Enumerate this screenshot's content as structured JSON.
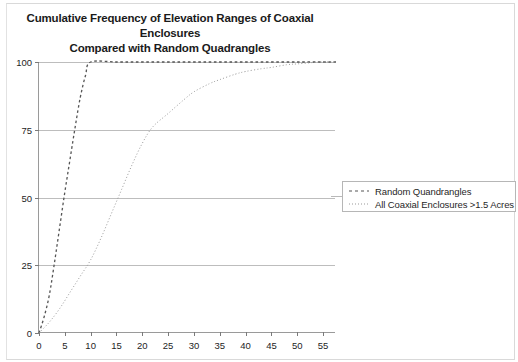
{
  "figure": {
    "width": 518,
    "height": 362,
    "background": "#ffffff",
    "border_color": "#d9d9d9"
  },
  "chart_data": {
    "type": "line",
    "title": "Cumulative Frequency of Elevation Ranges of Coaxial Enclosures Compared with Random Quadrangles",
    "title_line1": "Cumulative Frequency of Elevation Ranges of Coaxial Enclosures",
    "title_line2": "Compared with Random Quadrangles",
    "subtitle": "",
    "xlabel": "",
    "ylabel": "",
    "xlim": [
      0,
      57.5
    ],
    "ylim": [
      0,
      100
    ],
    "xticks": [
      0,
      5,
      10,
      15,
      20,
      25,
      30,
      35,
      40,
      45,
      50,
      55
    ],
    "yticks": [
      0,
      25,
      50,
      75,
      100
    ],
    "grid": "horizontal",
    "legend_position": "right-outside",
    "series": [
      {
        "name": "Random Quandrangles",
        "style": "dashed",
        "color": "#555555",
        "x": [
          0,
          1,
          2,
          3,
          4,
          5,
          6,
          7,
          8,
          9,
          10,
          15,
          20,
          25,
          30,
          35,
          40,
          45,
          50,
          55,
          57.5
        ],
        "values": [
          0,
          6,
          14,
          26,
          39,
          52,
          64,
          76,
          87,
          95,
          100,
          100,
          100,
          100,
          100,
          100,
          100,
          100,
          100,
          100,
          100
        ]
      },
      {
        "name": "All Coaxial Enclosures >1.5 Acres",
        "style": "dotted",
        "color": "#9a9a9a",
        "x": [
          0,
          2,
          4,
          6,
          8,
          10,
          12,
          14,
          16,
          18,
          20,
          22,
          25,
          28,
          30,
          33,
          35,
          38,
          40,
          43,
          45,
          48,
          50,
          53,
          55,
          57.5
        ],
        "values": [
          0,
          4,
          9,
          15,
          21,
          27,
          35,
          44,
          53,
          62,
          70,
          76,
          81,
          86,
          89,
          92,
          93.5,
          95.5,
          96.5,
          97.5,
          98,
          99,
          99.3,
          99.8,
          100,
          100
        ]
      }
    ]
  },
  "legend": {
    "items": [
      {
        "label": "Random Quandrangles",
        "style": "dashed",
        "color": "#555555"
      },
      {
        "label": "All Coaxial Enclosures >1.5 Acres",
        "style": "dotted",
        "color": "#9a9a9a"
      }
    ]
  },
  "axes": {
    "y_tick_labels": [
      "0",
      "25",
      "50",
      "75",
      "100"
    ],
    "x_tick_labels": [
      "0",
      "5",
      "10",
      "15",
      "20",
      "25",
      "30",
      "35",
      "40",
      "45",
      "50",
      "55"
    ],
    "axis_color": "#9a9a9a",
    "gridline_color": "#bdbdbd",
    "tick_label_color": "#242424"
  },
  "bottom_caption": {
    "text": ""
  }
}
